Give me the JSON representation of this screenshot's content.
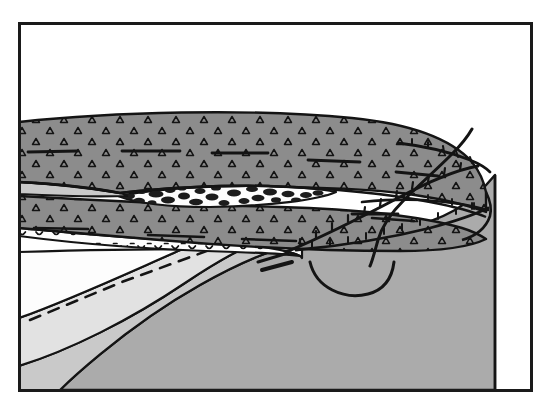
{
  "figure": {
    "domain": "geological-cross-section",
    "title": "",
    "caption": "",
    "width": 551,
    "height": 414,
    "background_color": "#ffffff"
  },
  "frame": {
    "name": "figure-border",
    "x": 18,
    "y": 22,
    "width": 515,
    "height": 370,
    "stroke_color": "#1a1a1a",
    "stroke_width": 3,
    "fill_color": "#ffffff"
  },
  "colors": {
    "conglomerate_gray": "#8c8c8c",
    "basement_gray": "#ababab",
    "interbed_light_gray": "#c9c9c9",
    "pale_gray": "#e2e2e2",
    "white_unit": "#fdfdfd",
    "line_black": "#141414",
    "clast_black": "#1c1c1c"
  },
  "units": [
    {
      "id": "upper-conglomerate",
      "label": "Upper conglomerate",
      "pattern": "open-triangle-clasts",
      "fill": "#8c8c8c",
      "description": "Wedge-shaped upper conglomerate sheet thinning to the right, ornamented with open triangle clast symbols and horizontal bedding dashes."
    },
    {
      "id": "interbed-light",
      "label": "Light interbed",
      "pattern": "plain",
      "fill": "#c9c9c9",
      "description": "Thin light-gray interbed separating upper and lower conglomerate on the left."
    },
    {
      "id": "breccia-lens",
      "label": "Breccia lens",
      "pattern": "irregular-black-clasts-on-white",
      "fill": "#fdfdfd",
      "description": "White lens with irregular black clast blobs, pinching out to left and right."
    },
    {
      "id": "lower-conglomerate",
      "label": "Lower conglomerate",
      "pattern": "open-triangle-clasts",
      "fill": "#8c8c8c",
      "description": "Lower conglomerate body below the breccia lens."
    },
    {
      "id": "scalloped-band",
      "label": "Scalloped marker band",
      "pattern": "dash-scallop",
      "fill": "#fdfdfd",
      "description": "Thin white band beneath the conglomerate marked with scalloped dash ornament."
    },
    {
      "id": "white-wedge",
      "label": "White wedge unit",
      "pattern": "plain",
      "fill": "#fdfdfd",
      "description": "White unit in the footwall, truncated by the dashed projection line."
    },
    {
      "id": "pale-wedge",
      "label": "Pale gray wedge",
      "pattern": "plain",
      "fill": "#e2e2e2",
      "description": "Pale gray layer beneath the white wedge, arcing down to the left margin."
    },
    {
      "id": "mid-gray-band",
      "label": "Mid gray band",
      "pattern": "plain",
      "fill": "#c9c9c9",
      "description": "Mid gray band between the pale wedge and the basement mass."
    },
    {
      "id": "basement",
      "label": "Basement block",
      "pattern": "plain",
      "fill": "#ababab",
      "description": "Large gray basement block forming the core of the structure on the right."
    }
  ],
  "structures": [
    {
      "id": "main-thrust",
      "label": "Main thrust fault",
      "type": "thrust-with-barbs",
      "style": "solid",
      "description": "Thrust surface climbing from lower right through the conglomerate, decorated with tick barbs on the hanging wall side."
    },
    {
      "id": "upper-thrust",
      "label": "Upper thrust splay",
      "type": "thrust-with-barbs",
      "style": "solid",
      "description": "Upper splay wrapping around the right nose of the conglomerate sheet."
    },
    {
      "id": "lower-thrust",
      "label": "Lower thrust splay",
      "type": "thrust-with-barbs",
      "style": "solid",
      "description": "Lower splay along the base of the conglomerate at the right end."
    },
    {
      "id": "back-thrust",
      "label": "Back-cutting fault",
      "type": "fault-line",
      "style": "solid",
      "description": "Steep fault rising from the basement through the right nose and out of the top of the conglomerate."
    },
    {
      "id": "basement-arc",
      "label": "Basement arc",
      "type": "arc",
      "style": "solid",
      "description": "Curved arc traced in the basement block below the thrust zone."
    },
    {
      "id": "projection-line",
      "label": "Projected horizon",
      "type": "dashed-line",
      "style": "dashed",
      "description": "Dashed line projecting an eroded horizon across the footwall wedge."
    },
    {
      "id": "bed-dashes",
      "label": "Bedding dashes",
      "type": "short-solid-segments",
      "style": "solid",
      "description": "Short heavy horizontal dashes marking bedding within the conglomerate units."
    },
    {
      "id": "slip-dash",
      "label": "Slip marker dash",
      "type": "short-thick-segment",
      "style": "solid",
      "description": "Short thick dash at the base of the thrust zone in the basement."
    }
  ],
  "annotations": {
    "text_labels": []
  }
}
